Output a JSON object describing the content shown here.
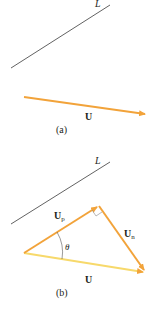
{
  "colors": {
    "vector_orange": "#f2a33a",
    "vector_yellow": "#f7d96b",
    "line": "#3a3a3a",
    "text": "#231f20"
  },
  "panel_a": {
    "line_label": "L",
    "vector_label": "U",
    "caption": "(a)"
  },
  "panel_b": {
    "line_label": "L",
    "projection_label": "U",
    "projection_subscript": "p",
    "normal_label": "U",
    "normal_subscript": "n",
    "vector_label": "U",
    "angle_label": "θ",
    "caption": "(b)"
  }
}
